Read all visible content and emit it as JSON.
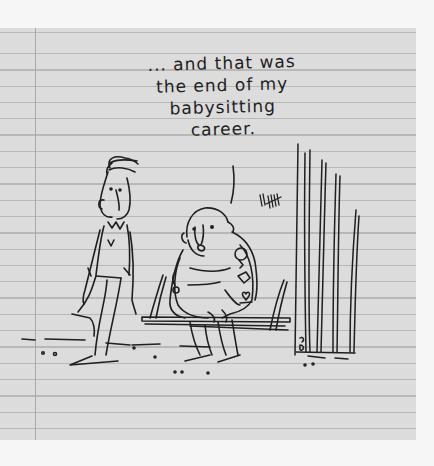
{
  "cartoon": {
    "caption_lines": [
      "... and that was",
      "the end of my",
      "babysitting",
      "career."
    ],
    "background": "lined notebook paper",
    "paper_color": "#dcdcdc",
    "ink_color": "#1f1f1f",
    "figures": [
      "standing-man",
      "bald-tattooed-man-on-bench"
    ],
    "props": [
      "bench",
      "jail-bars",
      "tally-marks"
    ],
    "tally_text": "IIЖ"
  }
}
